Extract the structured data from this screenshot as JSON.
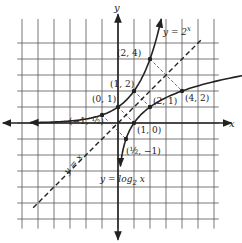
{
  "axes": {
    "x_label": "x",
    "y_label": "y"
  },
  "grid": {
    "x_range": [
      -6,
      6
    ],
    "y_range": [
      -6,
      6
    ]
  },
  "curves": {
    "exp_label": "y = 2",
    "exp_sup": "x",
    "log_label": "y = log",
    "log_sub": "2",
    "log_var": " x",
    "identity_label": "y = x"
  },
  "points": [
    {
      "label": "(2, 4)",
      "x": 2,
      "y": 4
    },
    {
      "label": "(1, 2)",
      "x": 1,
      "y": 2
    },
    {
      "label": "(0, 1)",
      "x": 0,
      "y": 1
    },
    {
      "label": "(−1, ½)",
      "x": -1,
      "y": 0.5
    },
    {
      "label": "(4, 2)",
      "x": 4,
      "y": 2
    },
    {
      "label": "(2, 1)",
      "x": 2,
      "y": 1
    },
    {
      "label": "(1, 0)",
      "x": 1,
      "y": 0
    },
    {
      "label": "(½, −1)",
      "x": 0.5,
      "y": -1
    }
  ]
}
